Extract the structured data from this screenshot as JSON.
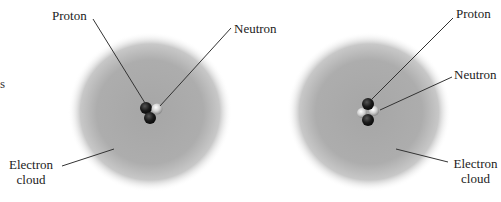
{
  "diagram": {
    "left_fragment": "s",
    "atoms": [
      {
        "name": "hydrogen-atom-variant-1",
        "nucleus": {
          "protons": 2,
          "neutrons": 1
        },
        "labels": {
          "proton": "Proton",
          "neutron": "Neutron",
          "electron_cloud_line1": "Electron",
          "electron_cloud_line2": "cloud"
        }
      },
      {
        "name": "atom-variant-2",
        "nucleus": {
          "protons": 2,
          "neutrons": 2
        },
        "labels": {
          "proton": "Proton",
          "neutron": "Neutron",
          "electron_cloud_line1": "Electron",
          "electron_cloud_line2": "cloud"
        }
      }
    ],
    "colors": {
      "cloud": "#a8a8a8",
      "proton": "#1e1e1e",
      "neutron": "#d8d8d8",
      "leader_line": "#333333",
      "text": "#222222"
    }
  }
}
